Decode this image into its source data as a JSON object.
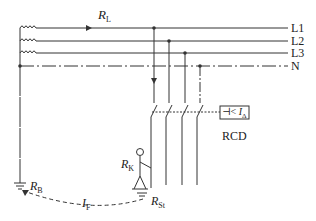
{
  "diagram": {
    "type": "electrical-schematic",
    "conductors": [
      {
        "id": "L1",
        "label": "L1"
      },
      {
        "id": "L2",
        "label": "L2"
      },
      {
        "id": "L3",
        "label": "L3"
      },
      {
        "id": "N",
        "label": "N"
      }
    ],
    "labels": {
      "line_resistance": {
        "main": "R",
        "sub": "L"
      },
      "body_resistance": {
        "main": "R",
        "sub": "K"
      },
      "operational_earth": {
        "main": "R",
        "sub": "B"
      },
      "standing_resistance": {
        "main": "R",
        "sub": "St"
      },
      "fault_current": {
        "main": "I",
        "sub": "F"
      },
      "rcd_trip": {
        "prefix": "⊣< ",
        "main": "I",
        "sub": "Δ"
      },
      "rcd": "RCD"
    },
    "colors": {
      "line": "#333333",
      "background": "#ffffff"
    }
  }
}
